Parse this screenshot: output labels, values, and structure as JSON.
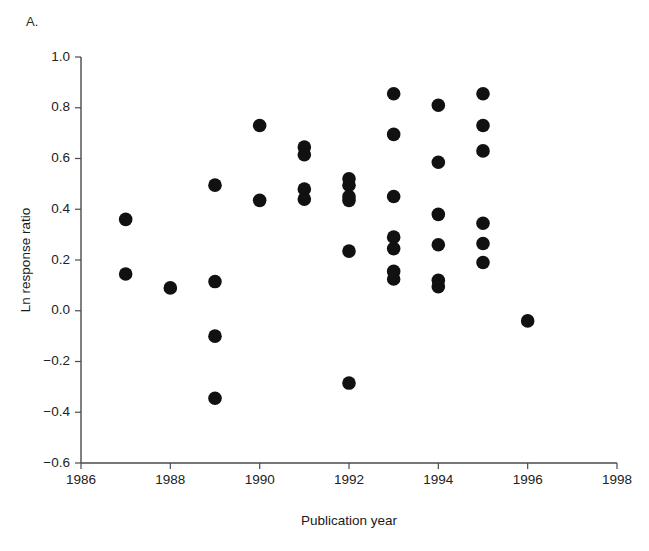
{
  "panel": {
    "label": "A."
  },
  "chart_data": {
    "type": "scatter",
    "title": "",
    "xlabel": "Publication year",
    "ylabel": "Ln response ratio",
    "xlim": [
      1986,
      1998
    ],
    "ylim": [
      -0.6,
      1.0
    ],
    "xticks": [
      1986,
      1988,
      1990,
      1992,
      1994,
      1996,
      1998
    ],
    "xticklabels": [
      "1986",
      "1988",
      "1990",
      "1992",
      "1994",
      "1996",
      "1998"
    ],
    "yticks": [
      -0.6,
      -0.4,
      -0.2,
      0.0,
      0.2,
      0.4,
      0.6,
      0.8,
      1.0
    ],
    "yticklabels": [
      "-0.6",
      "-0.4",
      "-0.2",
      "0.0",
      "0.2",
      "0.4",
      "0.6",
      "0.8",
      "1.0"
    ],
    "grid": false,
    "legend": null,
    "marker": {
      "shape": "circle",
      "color": "#111111",
      "size": 7
    },
    "points": [
      {
        "x": 1987,
        "y": 0.36
      },
      {
        "x": 1987,
        "y": 0.145
      },
      {
        "x": 1988,
        "y": 0.09
      },
      {
        "x": 1989,
        "y": 0.495
      },
      {
        "x": 1989,
        "y": 0.115
      },
      {
        "x": 1989,
        "y": -0.1
      },
      {
        "x": 1989,
        "y": -0.345
      },
      {
        "x": 1990,
        "y": 0.73
      },
      {
        "x": 1990,
        "y": 0.435
      },
      {
        "x": 1991,
        "y": 0.645
      },
      {
        "x": 1991,
        "y": 0.615
      },
      {
        "x": 1991,
        "y": 0.48
      },
      {
        "x": 1991,
        "y": 0.44
      },
      {
        "x": 1992,
        "y": 0.52
      },
      {
        "x": 1992,
        "y": 0.495
      },
      {
        "x": 1992,
        "y": 0.45
      },
      {
        "x": 1992,
        "y": 0.435
      },
      {
        "x": 1992,
        "y": 0.235
      },
      {
        "x": 1992,
        "y": -0.285
      },
      {
        "x": 1993,
        "y": 0.855
      },
      {
        "x": 1993,
        "y": 0.695
      },
      {
        "x": 1993,
        "y": 0.45
      },
      {
        "x": 1993,
        "y": 0.29
      },
      {
        "x": 1993,
        "y": 0.245
      },
      {
        "x": 1993,
        "y": 0.155
      },
      {
        "x": 1993,
        "y": 0.125
      },
      {
        "x": 1994,
        "y": 0.81
      },
      {
        "x": 1994,
        "y": 0.585
      },
      {
        "x": 1994,
        "y": 0.38
      },
      {
        "x": 1994,
        "y": 0.26
      },
      {
        "x": 1994,
        "y": 0.12
      },
      {
        "x": 1994,
        "y": 0.095
      },
      {
        "x": 1995,
        "y": 0.855
      },
      {
        "x": 1995,
        "y": 0.73
      },
      {
        "x": 1995,
        "y": 0.63
      },
      {
        "x": 1995,
        "y": 0.345
      },
      {
        "x": 1995,
        "y": 0.265
      },
      {
        "x": 1995,
        "y": 0.19
      },
      {
        "x": 1996,
        "y": -0.04
      }
    ]
  }
}
